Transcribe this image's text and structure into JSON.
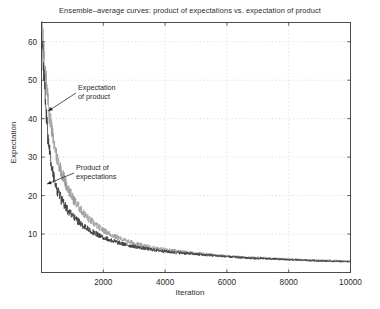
{
  "chart_data": {
    "type": "line",
    "title": "Ensemble–average curves: product of expectations vs. expectation of product",
    "xlabel": "Iteration",
    "ylabel": "Expectation",
    "xlim": [
      0,
      10000
    ],
    "ylim": [
      0,
      65
    ],
    "grid": true,
    "grid_style": "dotted",
    "legend": "none",
    "xticks": [
      2000,
      4000,
      6000,
      8000,
      10000
    ],
    "yticks": [
      10,
      20,
      30,
      40,
      50,
      60
    ],
    "annotations": [
      {
        "name": "expectation-of-product",
        "text_line1": "Expectation",
        "text_line2": "of product",
        "points_to_x": 220,
        "points_to_y": 42,
        "color": "#8c8c8c"
      },
      {
        "name": "product-of-expectations",
        "text_line1": "Product of",
        "text_line2": "expectations",
        "points_to_x": 180,
        "points_to_y": 23,
        "color": "#3a3a3a"
      }
    ],
    "series": [
      {
        "name": "Expectation of product",
        "color": "#9a9a9a",
        "description": "Upper lighter-gray noisy curve decaying from ~63 toward ~3",
        "x": [
          20,
          60,
          100,
          140,
          180,
          220,
          260,
          300,
          340,
          380,
          420,
          460,
          500,
          560,
          620,
          680,
          740,
          800,
          880,
          960,
          1040,
          1120,
          1200,
          1320,
          1440,
          1560,
          1680,
          1800,
          2000,
          2200,
          2400,
          2600,
          2800,
          3000,
          3300,
          3600,
          3900,
          4200,
          4500,
          4800,
          5200,
          5600,
          6000,
          6400,
          6800,
          7200,
          7600,
          8000,
          8500,
          9000,
          9500,
          10000
        ],
        "y": [
          63.0,
          58.5,
          54.0,
          50.5,
          47.0,
          43.5,
          41.0,
          38.5,
          36.5,
          34.5,
          33.0,
          31.5,
          30.0,
          28.5,
          27.0,
          25.5,
          24.3,
          23.0,
          21.5,
          20.2,
          19.0,
          18.0,
          17.2,
          15.8,
          14.7,
          13.7,
          12.9,
          12.1,
          11.0,
          10.1,
          9.3,
          8.7,
          8.1,
          7.6,
          7.0,
          6.5,
          6.1,
          5.8,
          5.5,
          5.2,
          4.9,
          4.6,
          4.3,
          4.1,
          3.9,
          3.8,
          3.6,
          3.5,
          3.3,
          3.2,
          3.1,
          3.0
        ]
      },
      {
        "name": "Product of expectations",
        "color": "#3f3f3f",
        "description": "Lower darker noisy curve decaying from ~62 toward ~2.8",
        "x": [
          20,
          60,
          100,
          140,
          180,
          220,
          260,
          300,
          340,
          380,
          420,
          460,
          500,
          560,
          620,
          680,
          740,
          800,
          880,
          960,
          1040,
          1120,
          1200,
          1320,
          1440,
          1560,
          1680,
          1800,
          2000,
          2200,
          2400,
          2600,
          2800,
          3000,
          3300,
          3600,
          3900,
          4200,
          4500,
          4800,
          5200,
          5600,
          6000,
          6400,
          6800,
          7200,
          7600,
          8000,
          8500,
          9000,
          9500,
          10000
        ],
        "y": [
          62.0,
          55.0,
          48.5,
          43.0,
          38.5,
          34.5,
          31.5,
          29.0,
          27.0,
          25.3,
          24.0,
          22.8,
          21.8,
          20.4,
          19.3,
          18.3,
          17.5,
          16.8,
          15.8,
          15.0,
          14.3,
          13.7,
          13.2,
          12.3,
          11.6,
          11.0,
          10.4,
          9.9,
          9.1,
          8.5,
          8.0,
          7.5,
          7.1,
          6.8,
          6.3,
          5.9,
          5.6,
          5.3,
          5.1,
          4.9,
          4.6,
          4.4,
          4.1,
          3.9,
          3.7,
          3.6,
          3.5,
          3.3,
          3.2,
          3.0,
          2.9,
          2.8
        ]
      }
    ]
  }
}
